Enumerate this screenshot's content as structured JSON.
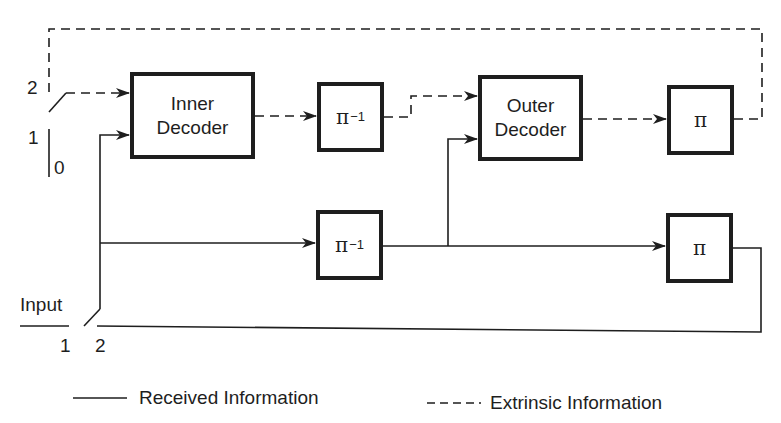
{
  "diagram": {
    "type": "serial concatenated turbo decoder block diagram",
    "blocks": {
      "inner_decoder": {
        "line1": "Inner",
        "line2": "Decoder"
      },
      "outer_decoder": {
        "line1": "Outer",
        "line2": "Decoder"
      },
      "deinterleaver_top": {
        "symbol": "π",
        "exponent": "−1"
      },
      "interleaver_top": {
        "symbol": "π"
      },
      "deinterleaver_bottom": {
        "symbol": "π",
        "exponent": "−1"
      },
      "interleaver_bottom": {
        "symbol": "π"
      }
    },
    "switch_top": {
      "pos_2": "2",
      "pos_1": "1",
      "pos_0": "0"
    },
    "switch_bottom": {
      "label": "Input",
      "pos_1": "1",
      "pos_2": "2"
    },
    "legend": {
      "solid": "Received Information",
      "dashed": "Extrinsic Information"
    },
    "colors": {
      "line": "#1e1e1e",
      "background": "#ffffff"
    }
  }
}
